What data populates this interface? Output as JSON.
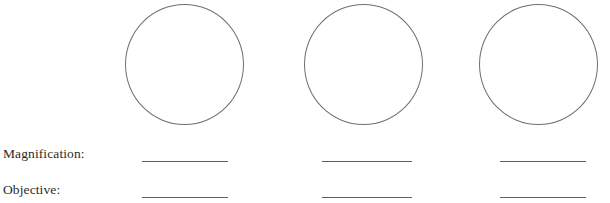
{
  "worksheet": {
    "background_color": "#ffffff",
    "stroke_color": "#6f6f72",
    "line_color": "#5d5d60",
    "text_color": "#2b2b2b"
  },
  "fields": {
    "magnification_label": "Magnification:",
    "objective_label": "Objective:"
  },
  "columns": [
    {
      "index": 1,
      "circle_name": "field-of-view-circle-1",
      "magnification_value": "",
      "objective_value": ""
    },
    {
      "index": 2,
      "circle_name": "field-of-view-circle-2",
      "magnification_value": "",
      "objective_value": ""
    },
    {
      "index": 3,
      "circle_name": "field-of-view-circle-3",
      "magnification_value": "",
      "objective_value": ""
    }
  ]
}
